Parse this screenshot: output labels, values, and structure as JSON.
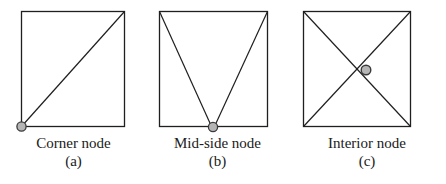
{
  "figure": {
    "background_color": "#ffffff",
    "line_color": "#1f1f1f",
    "node_fill_color": "#b5b5b5",
    "node_stroke_color": "#3a3a3a",
    "panels": [
      {
        "id": "a",
        "name": "corner-node-panel",
        "caption_name": "Corner node",
        "caption_tag": "(a)",
        "node_type": "corner",
        "node_label": "node-marker-corner",
        "square": {
          "x": 21,
          "y": 11,
          "width": 104,
          "height": 116
        },
        "node": {
          "cx": 21,
          "cy": 126,
          "r": 4.6
        },
        "internal_edges": [
          {
            "name": "diagonal-bottom-left-to-top-right",
            "x1": 21,
            "y1": 126,
            "x2": 125,
            "y2": 11
          }
        ]
      },
      {
        "id": "b",
        "name": "mid-side-node-panel",
        "caption_name": "Mid-side node",
        "caption_tag": "(b)",
        "node_type": "mid-side",
        "node_label": "node-marker-mid-side",
        "square": {
          "x": 159,
          "y": 11,
          "width": 109,
          "height": 116
        },
        "node": {
          "cx": 213,
          "cy": 127,
          "r": 4.6
        },
        "internal_edges": [
          {
            "name": "edge-top-left-to-mid-side",
            "x1": 159,
            "y1": 11,
            "x2": 212,
            "y2": 127
          },
          {
            "name": "edge-top-right-to-mid-side",
            "x1": 268,
            "y1": 11,
            "x2": 214,
            "y2": 127
          }
        ]
      },
      {
        "id": "c",
        "name": "interior-node-panel",
        "caption_name": "Interior node",
        "caption_tag": "(c)",
        "node_type": "interior",
        "node_label": "node-marker-interior",
        "square": {
          "x": 303,
          "y": 11,
          "width": 108,
          "height": 116
        },
        "node": {
          "cx": 366,
          "cy": 70,
          "r": 4.8
        },
        "internal_edges": [
          {
            "name": "diagonal-top-left-to-bottom-right",
            "x1": 303,
            "y1": 11,
            "x2": 411,
            "y2": 127
          },
          {
            "name": "diagonal-top-right-to-bottom-left",
            "x1": 411,
            "y1": 11,
            "x2": 303,
            "y2": 127
          }
        ]
      }
    ]
  }
}
